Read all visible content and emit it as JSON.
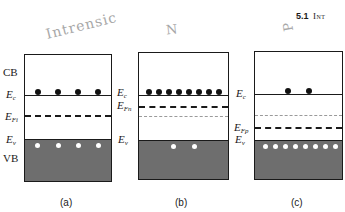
{
  "header": {
    "section_number": "5.1",
    "section_title_fragment": "Int"
  },
  "annotations": {
    "a": "Intrensic",
    "b": "N",
    "c": "P"
  },
  "band_labels": {
    "cb": "CB",
    "vb": "VB"
  },
  "panels": [
    {
      "id": "a",
      "caption": "(a)",
      "ec_label": "E",
      "ec_sub": "c",
      "ef_label": "E",
      "ef_sub": "Fi",
      "ev_label": "E",
      "ev_sub": "v",
      "electrons": 4,
      "holes": 4
    },
    {
      "id": "b",
      "caption": "(b)",
      "ec_label": "E",
      "ec_sub": "c",
      "ef_label": "E",
      "ef_sub": "Fn",
      "ev_label": "E",
      "ev_sub": "v",
      "electrons": 8,
      "holes": 2
    },
    {
      "id": "c",
      "caption": "(c)",
      "ec_label": "E",
      "ec_sub": "c",
      "ef_label": "E",
      "ef_sub": "Fp",
      "ev_label": "E",
      "ev_sub": "v",
      "electrons": 2,
      "holes": 8
    }
  ],
  "colors": {
    "valence_band_fill": "#6e6e6e",
    "line": "#1a1a1a",
    "intrinsic_level": "#9a9a9a"
  }
}
